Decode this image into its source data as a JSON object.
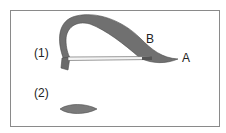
{
  "figure": {
    "labels": {
      "part1": "(1)",
      "part2": "(2)",
      "point_a": "A",
      "point_b": "B"
    },
    "colors": {
      "ribbon": "#6e6e6e",
      "ribbon_edge": "#4a4a4a",
      "strip": "#f2f2f2",
      "frame": "#8a8a8a",
      "text": "#222222"
    }
  }
}
